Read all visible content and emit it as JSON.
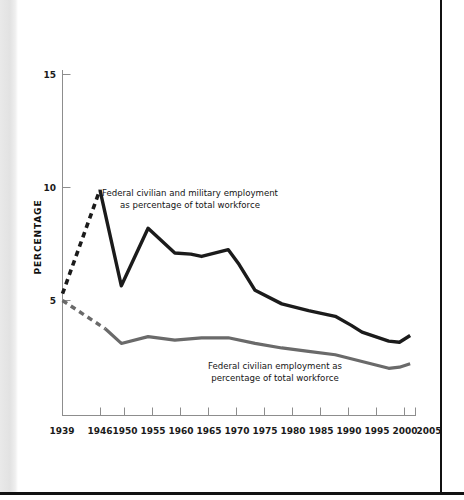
{
  "figure": {
    "y_axis_title": "PERCENTAGE",
    "y_ticks": [
      "15",
      "10",
      "5"
    ],
    "x_ticks": [
      "1939",
      "1946",
      "1950",
      "1955",
      "1960",
      "1965",
      "1970",
      "1975",
      "1980",
      "1985",
      "1990",
      "1995",
      "2000",
      "2005"
    ],
    "annotation_total_line1": "Federal civilian and military employment",
    "annotation_total_line2": "as percentage of total workforce",
    "annotation_civilian_line1": "Federal civilian employment as",
    "annotation_civilian_line2": "percentage of total workforce"
  },
  "colors": {
    "total_series": "#1b1b1b",
    "civilian_series": "#6a6a6a",
    "axis": "#8d8d8d",
    "page_border": "#111111",
    "background": "#ffffff"
  },
  "chart_data": {
    "type": "line",
    "title": "",
    "xlabel": "",
    "ylabel": "PERCENTAGE",
    "xlim": [
      1939,
      2005
    ],
    "ylim": [
      0,
      15.9
    ],
    "ytick_values": [
      5,
      10,
      15
    ],
    "xtick_values": [
      1939,
      1946,
      1950,
      1955,
      1960,
      1965,
      1970,
      1975,
      1980,
      1985,
      1990,
      1995,
      2000,
      2005
    ],
    "grid": false,
    "legend": "inline-annotations",
    "series": [
      {
        "name": "Federal civilian and military employment as percentage of total workforce",
        "color": "#1b1b1b",
        "style": "solid-with-dashed-prewar-segment",
        "dashed_x_range": [
          1939,
          1946
        ],
        "x": [
          1939,
          1946,
          1950,
          1955,
          1960,
          1963,
          1965,
          1970,
          1972,
          1975,
          1980,
          1985,
          1990,
          1993,
          1995,
          2000,
          2002,
          2004
        ],
        "y": [
          5.3,
          9.9,
          5.65,
          8.2,
          7.1,
          7.05,
          6.95,
          7.25,
          6.6,
          5.45,
          4.85,
          4.55,
          4.3,
          3.9,
          3.6,
          3.2,
          3.15,
          3.45
        ]
      },
      {
        "name": "Federal civilian employment as percentage of total workforce",
        "color": "#6a6a6a",
        "style": "solid-with-dashed-prewar-segment",
        "dashed_x_range": [
          1939,
          1947
        ],
        "x": [
          1939,
          1947,
          1950,
          1955,
          1960,
          1965,
          1970,
          1975,
          1980,
          1985,
          1990,
          1995,
          2000,
          2002,
          2004
        ],
        "y": [
          5.0,
          3.75,
          3.1,
          3.4,
          3.25,
          3.35,
          3.35,
          3.1,
          2.9,
          2.75,
          2.6,
          2.3,
          2.0,
          2.05,
          2.2
        ]
      }
    ]
  }
}
